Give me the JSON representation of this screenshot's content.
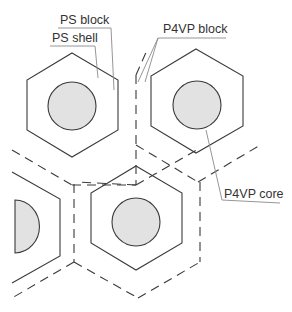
{
  "diagram": {
    "labels": {
      "ps_block": "PS block",
      "ps_shell": "PS shell",
      "p4vp_block": "P4VP block",
      "p4vp_core": "P4VP core"
    },
    "colors": {
      "core_fill": "#e2e2e2",
      "stroke": "#3a3a3a",
      "leader": "#8a8a8a"
    },
    "components": [
      {
        "name": "P4VP core",
        "shape": "circle",
        "fill": "gray"
      },
      {
        "name": "PS shell",
        "shape": "hexagon",
        "line": "solid"
      },
      {
        "name": "P4VP block",
        "shape": "hexagon boundary",
        "line": "dashed"
      },
      {
        "name": "PS block",
        "shape": "region between core and hexagon"
      }
    ]
  }
}
